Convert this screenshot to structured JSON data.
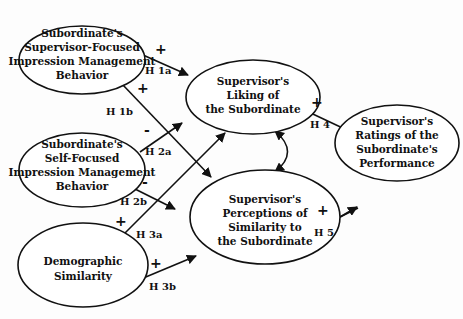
{
  "diagram": {
    "nodes": [
      {
        "id": "sup_focused_im",
        "lines": [
          "Subordinate's",
          "Supervisor-Focused",
          "Impression Management",
          "Behavior"
        ]
      },
      {
        "id": "liking",
        "lines": [
          "Supervisor's",
          "Liking of",
          "the Subordinate"
        ]
      },
      {
        "id": "self_focused_im",
        "lines": [
          "Subordinate's",
          "Self-Focused",
          "Impression Management",
          "Behavior"
        ]
      },
      {
        "id": "perceived_similarity",
        "lines": [
          "Supervisor's",
          "Perceptions of",
          "Similarity to",
          "the Subordinate"
        ]
      },
      {
        "id": "performance_ratings",
        "lines": [
          "Supervisor's",
          "Ratings of the",
          "Subordinate's",
          "Performance"
        ]
      },
      {
        "id": "demographic_similarity",
        "lines": [
          "Demographic",
          "Similarity"
        ]
      }
    ],
    "edges": [
      {
        "from": "sup_focused_im",
        "to": "liking",
        "label": "H 1a",
        "sign": "+"
      },
      {
        "from": "sup_focused_im",
        "to": "perceived_similarity",
        "label": "H 1b",
        "sign": "+"
      },
      {
        "from": "self_focused_im",
        "to": "liking",
        "label": "H 2a",
        "sign": "-"
      },
      {
        "from": "self_focused_im",
        "to": "perceived_similarity",
        "label": "H 2b",
        "sign": "-"
      },
      {
        "from": "demographic_similarity",
        "to": "liking",
        "label": "H 3a",
        "sign": "+"
      },
      {
        "from": "demographic_similarity",
        "to": "perceived_similarity",
        "label": "H 3b",
        "sign": "+"
      },
      {
        "from": "liking",
        "to": "performance_ratings",
        "label": "H 4",
        "sign": "+"
      },
      {
        "from": "perceived_similarity",
        "to": "performance_ratings",
        "label": "H 5",
        "sign": "+"
      },
      {
        "from": "liking",
        "to": "perceived_similarity",
        "label": "",
        "sign": "",
        "bidirectional": true
      }
    ]
  }
}
